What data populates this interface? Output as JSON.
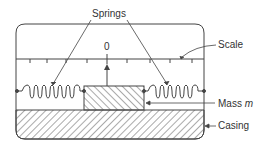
{
  "diagram": {
    "type": "accelerometer-schematic",
    "labels": {
      "springs": "Springs",
      "scale": "Scale",
      "mass": "Mass",
      "mass_symbol": "m",
      "casing": "Casing",
      "zero": "0"
    },
    "colors": {
      "line": "#444444",
      "text": "#333333",
      "background": "#ffffff"
    }
  }
}
